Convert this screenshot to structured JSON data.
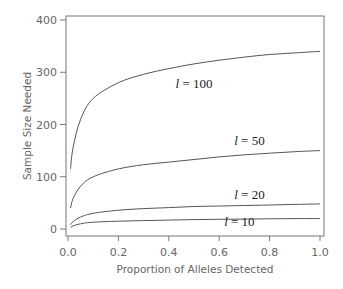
{
  "chart_data": {
    "type": "line",
    "title": "",
    "xlabel": "Proportion of Alleles Detected",
    "ylabel": "Sample Size Needed",
    "xlim": [
      0.0,
      1.0
    ],
    "ylim": [
      0,
      400
    ],
    "x_ticks": [
      "0.0",
      "0.2",
      "0.4",
      "0.6",
      "0.8",
      "1.0"
    ],
    "y_ticks": [
      "0",
      "100",
      "200",
      "300",
      "400"
    ],
    "grid": false,
    "legend": "none (inline curve labels)",
    "x": [
      0.01,
      0.02,
      0.05,
      0.1,
      0.2,
      0.3,
      0.4,
      0.5,
      0.6,
      0.7,
      0.8,
      0.9,
      1.0
    ],
    "series": [
      {
        "name": "l = 100",
        "label_var": "l",
        "label_val": "= 100",
        "values": [
          115,
          155,
          210,
          250,
          280,
          296,
          307,
          316,
          323,
          329,
          334,
          337,
          340
        ]
      },
      {
        "name": "l = 50",
        "label_var": "l",
        "label_val": "= 50",
        "values": [
          40,
          58,
          82,
          100,
          115,
          123,
          128,
          133,
          138,
          142,
          145,
          148,
          150
        ]
      },
      {
        "name": "l = 20",
        "label_var": "l",
        "label_val": "= 20",
        "values": [
          8,
          14,
          23,
          30,
          36,
          39,
          41,
          43,
          44,
          45,
          46,
          47,
          48
        ]
      },
      {
        "name": "l = 10",
        "label_var": "l",
        "label_val": "= 10",
        "values": [
          3,
          6,
          10,
          13,
          15,
          16,
          17,
          18,
          18.5,
          19,
          19.5,
          20,
          20
        ]
      }
    ],
    "annotations": [
      {
        "text": "l = 100",
        "x": 0.5,
        "y": 270
      },
      {
        "text": "l = 50",
        "x": 0.72,
        "y": 160
      },
      {
        "text": "l = 20",
        "x": 0.72,
        "y": 57
      },
      {
        "text": "l = 10",
        "x": 0.68,
        "y": 5
      }
    ]
  },
  "colors": {
    "line": "#555555",
    "axis": "#777777",
    "text": "#666666",
    "label": "#222222"
  }
}
